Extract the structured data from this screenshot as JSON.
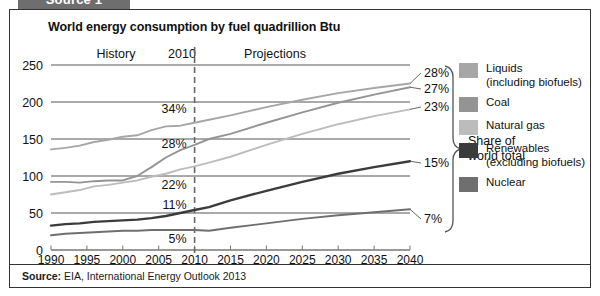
{
  "source_tab": {
    "label": "Source 1"
  },
  "header": {
    "title": "World energy consumption by fuel quadrillion Btu"
  },
  "footer": {
    "source_prefix": "Source:",
    "source_text": " EIA, International Energy Outlook 2013"
  },
  "annotations": {
    "history": "History",
    "divider_year": "2010",
    "projections": "Projections",
    "brace_label_line1": "Share of",
    "brace_label_line2": "world total"
  },
  "legend": {
    "items": [
      {
        "label": "Liquids\n(including biofuels)",
        "color": "#a6a6a6",
        "name": "liquids"
      },
      {
        "label": "Coal",
        "color": "#949494",
        "name": "coal"
      },
      {
        "label": "Natural gas",
        "color": "#bcbcbc",
        "name": "natural-gas"
      },
      {
        "label": "Renewables\n(excluding biofuels)",
        "color": "#3b3b3b",
        "name": "renewables"
      },
      {
        "label": "Nuclear",
        "color": "#6f6f6f",
        "name": "nuclear"
      }
    ]
  },
  "chart_data": {
    "type": "line",
    "title": "World energy consumption by fuel quadrillion Btu",
    "xlabel": "",
    "ylabel": "quadrillion Btu",
    "xlim": [
      1990,
      2040
    ],
    "ylim": [
      0,
      250
    ],
    "ytick_values": [
      0,
      50,
      100,
      150,
      200,
      250
    ],
    "ytick_labels": [
      "0",
      "50",
      "100",
      "150",
      "200",
      "250"
    ],
    "xtick_values": [
      1990,
      1995,
      2000,
      2005,
      2010,
      2015,
      2020,
      2025,
      2030,
      2035,
      2040
    ],
    "xtick_labels": [
      "1990",
      "1995",
      "2000",
      "2005",
      "2010",
      "2015",
      "2020",
      "2025",
      "2030",
      "2035",
      "2040"
    ],
    "grid": "horizontal",
    "legend_position": "right",
    "divider_x": 2010,
    "divider_style": "dashed",
    "x": [
      1990,
      1992,
      1994,
      1996,
      1998,
      2000,
      2002,
      2004,
      2006,
      2008,
      2010,
      2012,
      2015,
      2020,
      2025,
      2030,
      2035,
      2040
    ],
    "series": [
      {
        "name": "Liquids (including biofuels)",
        "color": "#a6a6a6",
        "values": [
          136,
          138,
          141,
          146,
          149,
          153,
          155,
          162,
          167,
          168,
          172,
          176,
          182,
          193,
          203,
          212,
          219,
          225
        ],
        "label_2010": "34%",
        "label_2040": "28%"
      },
      {
        "name": "Coal",
        "color": "#949494",
        "values": [
          92,
          92,
          91,
          93,
          94,
          94,
          100,
          112,
          125,
          135,
          142,
          150,
          157,
          172,
          186,
          199,
          210,
          220
        ],
        "label_2010": "28%",
        "label_2040": "27%"
      },
      {
        "name": "Natural gas",
        "color": "#bcbcbc",
        "values": [
          75,
          78,
          81,
          86,
          88,
          91,
          94,
          99,
          103,
          109,
          113,
          118,
          126,
          142,
          157,
          170,
          181,
          190
        ],
        "label_2010": "22%",
        "label_2040": "23%"
      },
      {
        "name": "Renewables (excluding biofuels)",
        "color": "#3b3b3b",
        "values": [
          33,
          35,
          36,
          38,
          39,
          40,
          41,
          43,
          46,
          50,
          54,
          58,
          67,
          80,
          92,
          103,
          112,
          120
        ],
        "label_2010": "11%",
        "label_2040": "15%"
      },
      {
        "name": "Nuclear",
        "color": "#6f6f6f",
        "values": [
          20,
          22,
          23,
          24,
          25,
          26,
          26,
          27,
          27,
          27,
          27,
          26,
          30,
          36,
          42,
          47,
          51,
          55
        ],
        "label_2010": "5%",
        "label_2040": "7%"
      }
    ],
    "share_labels_2010": [
      "34%",
      "28%",
      "22%",
      "11%",
      "5%"
    ],
    "share_labels_2040": [
      "28%",
      "27%",
      "23%",
      "15%",
      "7%"
    ]
  }
}
